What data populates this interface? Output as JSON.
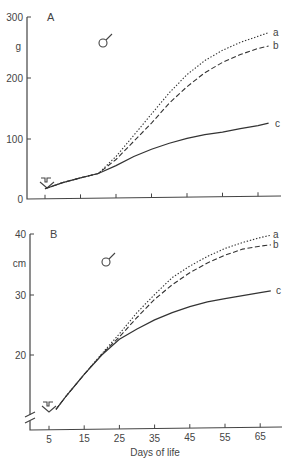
{
  "chart_data": [
    {
      "panel": "A",
      "type": "line",
      "title": "A",
      "sex_symbol": "male",
      "xlabel": "",
      "ylabel": "g",
      "ylim": [
        0,
        300
      ],
      "yticks": [
        0,
        100,
        200,
        300
      ],
      "ytick_labels": [
        "0",
        "100",
        "200",
        "300"
      ],
      "xticks": [
        5,
        15,
        25,
        35,
        45,
        55,
        65
      ],
      "xtick_labels": [],
      "arrow_marker_day": 5,
      "series": [
        {
          "name": "a",
          "style": "dotted",
          "x": [
            5,
            10,
            15,
            20,
            25,
            30,
            35,
            40,
            45,
            50,
            55,
            60,
            65,
            68
          ],
          "y": [
            17,
            27,
            35,
            42,
            70,
            105,
            140,
            175,
            205,
            228,
            245,
            258,
            268,
            274
          ]
        },
        {
          "name": "b",
          "style": "dashed",
          "x": [
            5,
            10,
            15,
            20,
            25,
            30,
            35,
            40,
            45,
            50,
            55,
            60,
            65,
            68
          ],
          "y": [
            17,
            27,
            35,
            42,
            65,
            95,
            125,
            158,
            185,
            208,
            225,
            238,
            248,
            252
          ]
        },
        {
          "name": "c",
          "style": "solid",
          "x": [
            5,
            10,
            15,
            20,
            25,
            30,
            35,
            40,
            45,
            50,
            55,
            60,
            65,
            68
          ],
          "y": [
            17,
            27,
            35,
            42,
            55,
            70,
            82,
            92,
            100,
            106,
            110,
            116,
            121,
            125
          ]
        }
      ]
    },
    {
      "panel": "B",
      "type": "line",
      "title": "B",
      "sex_symbol": "male",
      "xlabel": "Days of life",
      "ylabel": "cm",
      "ylim": [
        10,
        40
      ],
      "yticks": [
        20,
        30,
        40
      ],
      "ytick_labels": [
        "20",
        "30",
        "40"
      ],
      "axis_break": true,
      "xticks": [
        5,
        15,
        25,
        35,
        45,
        55,
        65
      ],
      "xtick_labels": [
        "5",
        "15",
        "25",
        "35",
        "45",
        "55",
        "65"
      ],
      "arrow_marker_day": 5,
      "series": [
        {
          "name": "a",
          "style": "dotted",
          "x": [
            7,
            10,
            15,
            20,
            25,
            30,
            35,
            40,
            45,
            50,
            55,
            60,
            65,
            68
          ],
          "y": [
            11,
            13.3,
            16.8,
            20.2,
            23.5,
            27,
            30,
            32.8,
            34.7,
            36.3,
            37.6,
            38.6,
            39.4,
            39.8
          ]
        },
        {
          "name": "b",
          "style": "dashed",
          "x": [
            7,
            10,
            15,
            20,
            25,
            30,
            35,
            40,
            45,
            50,
            55,
            60,
            65,
            68
          ],
          "y": [
            11,
            13.3,
            16.8,
            20.1,
            23,
            26.2,
            29.2,
            31.6,
            33.6,
            35.2,
            36.5,
            37.5,
            38,
            38.2
          ]
        },
        {
          "name": "c",
          "style": "solid",
          "x": [
            7,
            10,
            15,
            20,
            25,
            30,
            35,
            40,
            45,
            50,
            55,
            60,
            65,
            68
          ],
          "y": [
            11,
            13.3,
            16.8,
            20,
            22.6,
            24.3,
            25.8,
            27,
            28,
            28.8,
            29.3,
            29.8,
            30.3,
            30.6
          ]
        }
      ]
    }
  ]
}
